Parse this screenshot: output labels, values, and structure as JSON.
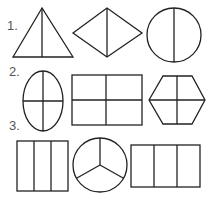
{
  "rows": [
    {
      "label": "1.",
      "shapes": [
        "triangle-halved",
        "rhombus-halved",
        "circle-halved"
      ]
    },
    {
      "label": "2.",
      "shapes": [
        "ellipse-quartered",
        "rectangle-quartered",
        "hexagon-quartered"
      ]
    },
    {
      "label": "3.",
      "shapes": [
        "rectangle-thirds",
        "circle-thirds",
        "rectangle-thirds"
      ]
    }
  ],
  "colors": {
    "stroke": "#222222",
    "label": "#555555",
    "background": "#ffffff"
  }
}
